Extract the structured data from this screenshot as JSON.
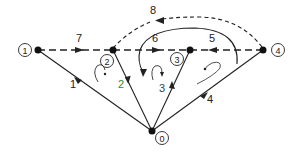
{
  "diagram": {
    "type": "directed-graph",
    "nodes": [
      {
        "id": "0",
        "label": "0",
        "x": 152,
        "y": 131,
        "lx": 161,
        "ly": 138
      },
      {
        "id": "1",
        "label": "1",
        "x": 38,
        "y": 50,
        "lx": 25,
        "ly": 50
      },
      {
        "id": "2",
        "label": "2",
        "x": 113,
        "y": 50,
        "lx": 108,
        "ly": 62
      },
      {
        "id": "3",
        "label": "3",
        "x": 190,
        "y": 50,
        "lx": 176,
        "ly": 58
      },
      {
        "id": "4",
        "label": "4",
        "x": 263,
        "y": 50,
        "lx": 278,
        "ly": 50
      }
    ],
    "edges": [
      {
        "id": "1",
        "label": "1",
        "from": "0",
        "to": "1",
        "style": "solid",
        "label_color": "#222222"
      },
      {
        "id": "2",
        "label": "2",
        "from": "0",
        "to": "2",
        "style": "solid",
        "label_color": "#3a8a2a"
      },
      {
        "id": "3",
        "label": "3",
        "from": "0",
        "to": "3",
        "style": "solid",
        "label_color": "#2a4a4a"
      },
      {
        "id": "4",
        "label": "4",
        "from": "0",
        "to": "4",
        "style": "solid",
        "label_color": "#222222"
      },
      {
        "id": "5",
        "label": "5",
        "from": "4",
        "to": "3",
        "style": "dashed",
        "label_color": "#222222"
      },
      {
        "id": "6",
        "label": "6",
        "from": "2",
        "to": "3",
        "style": "dashed",
        "label_color": "#222222"
      },
      {
        "id": "7",
        "label": "7",
        "from": "1",
        "to": "2",
        "style": "dashed",
        "label_color": "#222222"
      },
      {
        "id": "8",
        "label": "8",
        "from": "4",
        "to": "2",
        "style": "dashed-curve",
        "label_color": "#222222"
      }
    ],
    "colors": {
      "line": "#222222",
      "background": "#ffffff"
    }
  }
}
